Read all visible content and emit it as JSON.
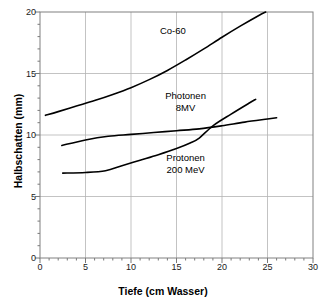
{
  "chart_data": {
    "type": "line",
    "title": "",
    "xlabel": "Tiefe (cm Wasser)",
    "ylabel": "Halbschatten (mm)",
    "xlim": [
      0,
      30
    ],
    "ylim": [
      0,
      20
    ],
    "xticks": [
      0,
      5,
      10,
      15,
      20,
      25,
      30
    ],
    "yticks": [
      0,
      5,
      10,
      15,
      20
    ],
    "xtick_labels": [
      "0",
      "5",
      "10",
      "15",
      "20",
      "25",
      "30"
    ],
    "ytick_labels": [
      "0",
      "5",
      "10",
      "15",
      "20"
    ],
    "x_minor_tick_step": 1,
    "y_minor_tick_step": 1,
    "grid": "both",
    "grid_color": "#b4b4b4",
    "frame": true,
    "line_color": "#000000",
    "line_width": 1.6,
    "legend_position": "inline-annotations",
    "series": [
      {
        "name": "Co-60",
        "label": "Co-60",
        "label_x": 14.6,
        "label_y": 18.4,
        "points": [
          [
            0.6,
            11.6
          ],
          [
            2.0,
            11.9
          ],
          [
            4.0,
            12.35
          ],
          [
            6.0,
            12.8
          ],
          [
            8.0,
            13.3
          ],
          [
            10.0,
            13.85
          ],
          [
            12.0,
            14.5
          ],
          [
            14.0,
            15.25
          ],
          [
            16.0,
            16.1
          ],
          [
            18.0,
            17.0
          ],
          [
            20.0,
            17.95
          ],
          [
            22.0,
            18.85
          ],
          [
            24.0,
            19.7
          ],
          [
            24.8,
            20.0
          ]
        ]
      },
      {
        "name": "Photonen 8MV",
        "label": "Photonen\n8MV",
        "label_x": 16.0,
        "label_y": 13.1,
        "points": [
          [
            2.4,
            9.15
          ],
          [
            5.0,
            9.6
          ],
          [
            7.5,
            9.9
          ],
          [
            10.0,
            10.05
          ],
          [
            12.5,
            10.2
          ],
          [
            15.0,
            10.35
          ],
          [
            17.5,
            10.5
          ],
          [
            20.0,
            10.75
          ],
          [
            22.5,
            11.05
          ],
          [
            25.0,
            11.3
          ],
          [
            26.0,
            11.4
          ]
        ]
      },
      {
        "name": "Protonen 200 MeV",
        "label": "Protonen\n200 MeV",
        "label_x": 16.0,
        "label_y": 8.05,
        "points": [
          [
            2.5,
            6.9
          ],
          [
            5.0,
            6.95
          ],
          [
            7.2,
            7.1
          ],
          [
            9.0,
            7.5
          ],
          [
            11.0,
            7.95
          ],
          [
            13.0,
            8.4
          ],
          [
            15.0,
            8.9
          ],
          [
            16.5,
            9.35
          ],
          [
            17.5,
            9.75
          ],
          [
            19.0,
            10.75
          ],
          [
            21.0,
            11.7
          ],
          [
            23.0,
            12.6
          ],
          [
            23.7,
            12.9
          ]
        ]
      }
    ]
  },
  "axes": {
    "x_title": "Tiefe (cm Wasser)",
    "y_title": "Halbschatten (mm)"
  }
}
